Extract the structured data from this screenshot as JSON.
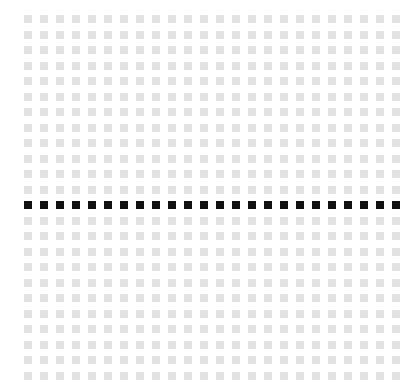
{
  "grid": {
    "rows": 24,
    "cols": 24,
    "origin_x": 24,
    "origin_y": 15,
    "step_x": 16,
    "step_y": 15.5,
    "cell_size": 8,
    "highlight_row": 12,
    "colors": {
      "background": "#ffffff",
      "cell": "#e2e2e2",
      "highlight": "#111111"
    }
  }
}
